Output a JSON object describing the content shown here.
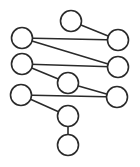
{
  "diagram": {
    "type": "graph",
    "width": 140,
    "height": 167,
    "colors": {
      "stroke": "#2a2a2a",
      "fill": "#ffffff",
      "background": "#ffffff"
    },
    "node_radius": 10.5,
    "nodes": [
      {
        "id": "n1",
        "x": 71,
        "y": 21
      },
      {
        "id": "n2",
        "x": 22,
        "y": 38
      },
      {
        "id": "n3",
        "x": 118,
        "y": 40
      },
      {
        "id": "n4",
        "x": 22,
        "y": 64
      },
      {
        "id": "n5",
        "x": 118,
        "y": 67
      },
      {
        "id": "n6",
        "x": 68,
        "y": 83
      },
      {
        "id": "n7",
        "x": 21,
        "y": 95
      },
      {
        "id": "n8",
        "x": 117,
        "y": 97
      },
      {
        "id": "n9",
        "x": 68,
        "y": 116
      },
      {
        "id": "n10",
        "x": 68,
        "y": 145
      }
    ],
    "edges": [
      {
        "from": "n1",
        "to": "n3"
      },
      {
        "from": "n2",
        "to": "n3"
      },
      {
        "from": "n2",
        "to": "n5"
      },
      {
        "from": "n4",
        "to": "n5"
      },
      {
        "from": "n4",
        "to": "n6"
      },
      {
        "from": "n6",
        "to": "n8"
      },
      {
        "from": "n7",
        "to": "n8"
      },
      {
        "from": "n7",
        "to": "n9"
      },
      {
        "from": "n9",
        "to": "n10"
      }
    ]
  }
}
